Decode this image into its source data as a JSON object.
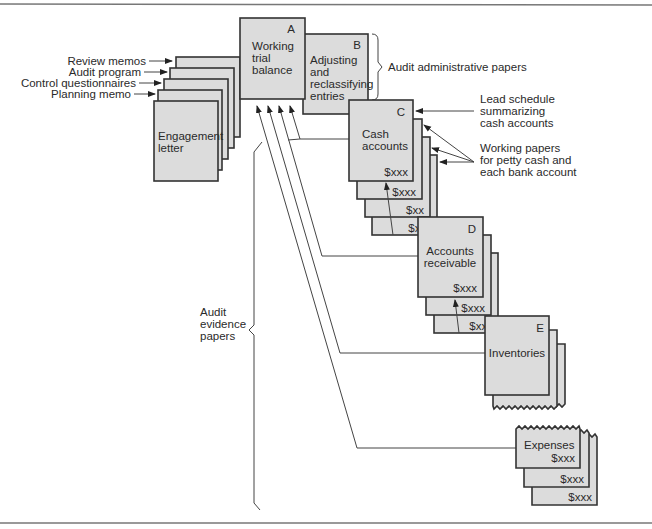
{
  "diagram": {
    "left_labels": {
      "review_memos": "Review memos",
      "audit_program": "Audit program",
      "control_questionnaires": "Control questionnaires",
      "planning_memo": "Planning memo"
    },
    "engagement_letter": [
      "Engagement",
      "letter"
    ],
    "box_a": {
      "letter": "A",
      "lines": [
        "Working",
        "trial",
        "balance"
      ]
    },
    "box_b": {
      "letter": "B",
      "lines": [
        "Adjusting",
        "and",
        "reclassifying",
        "entries"
      ]
    },
    "box_c": {
      "letter": "C",
      "lines": [
        "Cash",
        "accounts"
      ],
      "amounts": [
        "$xxx",
        "$xxx",
        "$xx",
        "$xxx"
      ]
    },
    "box_d": {
      "letter": "D",
      "lines": [
        "Accounts",
        "receivable"
      ],
      "amounts": [
        "$xxx",
        "$xxx",
        "$xxx"
      ]
    },
    "box_e": {
      "letter": "E",
      "lines": [
        "Inventories"
      ]
    },
    "box_expenses": {
      "lines": [
        "Expenses"
      ],
      "amounts": [
        "$xxx",
        "$xxx",
        "$xxx"
      ]
    },
    "annotations": {
      "audit_admin": "Audit administrative papers",
      "lead_schedule": [
        "Lead schedule",
        "summarizing",
        "cash accounts"
      ],
      "working_papers": [
        "Working papers",
        "for petty cash and",
        "each bank account"
      ],
      "audit_evidence": [
        "Audit",
        "evidence",
        "papers"
      ]
    }
  }
}
